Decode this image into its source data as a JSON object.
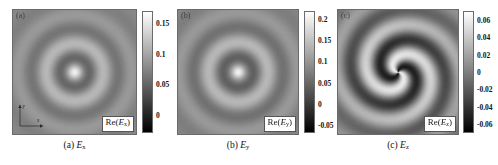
{
  "figure": {
    "type": "scientific-figure"
  },
  "panels": [
    {
      "tag": "(a)",
      "field_label_prefix": "Re(",
      "field_label_var": "E",
      "field_label_sub": "x",
      "field_label_suffix": ")",
      "caption_tag": "(a)",
      "caption_var": "E",
      "caption_sub": "x",
      "axis_x_label": "x",
      "axis_y_label": "y",
      "pattern": "concentric-rings"
    },
    {
      "tag": "(b)",
      "field_label_prefix": "Re(",
      "field_label_var": "E",
      "field_label_sub": "y",
      "field_label_suffix": ")",
      "caption_tag": "(b)",
      "caption_var": "E",
      "caption_sub": "y",
      "pattern": "concentric-rings"
    },
    {
      "tag": "(c)",
      "field_label_prefix": "Re(",
      "field_label_var": "E",
      "field_label_sub": "z",
      "field_label_suffix": ")",
      "caption_tag": "(c)",
      "caption_var": "E",
      "caption_sub": "z",
      "pattern": "double-arm-spiral"
    }
  ],
  "chart_data": [
    {
      "type": "heatmap",
      "title": "Re(Ex)",
      "panel": "(a)",
      "colormap": "gray",
      "colorbar_ticks": [
        "0.15",
        "0.1",
        "0.05",
        "0"
      ],
      "colorbar_values": [
        0.15,
        0.1,
        0.05,
        0
      ],
      "zlim": [
        -0.03,
        0.17
      ],
      "vmin": -0.03,
      "vmax": 0.17,
      "xlabel": "x",
      "ylabel": "y",
      "grid": false,
      "radial_profile_note": "concentric rings, bright central spot, strong dark annulus at mid radius"
    },
    {
      "type": "heatmap",
      "title": "Re(Ey)",
      "panel": "(b)",
      "colormap": "gray",
      "colorbar_ticks": [
        "0.2",
        "0.15",
        "0.1",
        "0.05",
        "0",
        "-0.05"
      ],
      "colorbar_values": [
        0.2,
        0.15,
        0.1,
        0.05,
        0,
        -0.05
      ],
      "zlim": [
        -0.07,
        0.22
      ],
      "vmin": -0.07,
      "vmax": 0.22,
      "xlabel": "",
      "ylabel": "",
      "grid": false,
      "radial_profile_note": "concentric rings, bright central spot, broad dark annulus"
    },
    {
      "type": "heatmap",
      "title": "Re(Ez)",
      "panel": "(c)",
      "colormap": "gray",
      "colorbar_ticks": [
        "0.06",
        "0.04",
        "0.02",
        "0",
        "-0.02",
        "-0.04",
        "-0.06"
      ],
      "colorbar_values": [
        0.06,
        0.04,
        0.02,
        0,
        -0.02,
        -0.04,
        -0.06
      ],
      "zlim": [
        -0.07,
        0.07
      ],
      "vmin": -0.07,
      "vmax": 0.07,
      "xlabel": "",
      "ylabel": "",
      "grid": false,
      "radial_profile_note": "two-arm spiral, azimuthal order m=2, antisymmetric about center"
    }
  ],
  "colors": {
    "background": "#ffffff",
    "text": "#111111",
    "panel_border": "#6b6b6b",
    "colormap_low": "#000000",
    "colormap_high": "#ffffff"
  }
}
